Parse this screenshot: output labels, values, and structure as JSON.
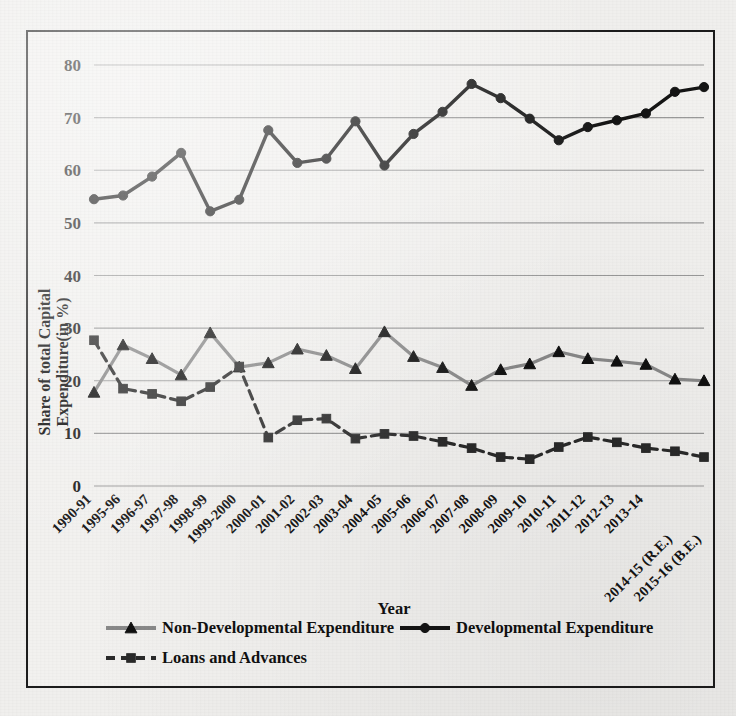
{
  "figure": {
    "background_color": "#f2f1ef",
    "frame_color": "#1c1c1c",
    "xlabel": "Year",
    "ylabel_line1": "Share of total Capital",
    "ylabel_line2": "Expenditure(in %)"
  },
  "legend": {
    "position": "bottom-left",
    "entries": [
      {
        "label": "Non-Developmental Expenditure",
        "marker": "triangle",
        "color": "#8a8a8a",
        "line": "solid"
      },
      {
        "label": "Developmental Expenditure",
        "marker": "circle",
        "color": "#141414",
        "line": "solid"
      },
      {
        "label": "Loans and Advances",
        "marker": "square",
        "color": "#2a2a2a",
        "line": "dashed"
      }
    ]
  },
  "chart_data": {
    "type": "line",
    "title": "",
    "xlabel": "Year",
    "ylabel": "Share of total Capital Expenditure(in %)",
    "ylim": [
      0,
      80
    ],
    "ytick_step": 10,
    "yticks": [
      0,
      10,
      20,
      30,
      40,
      50,
      60,
      70,
      80
    ],
    "grid": true,
    "grid_axis": "y",
    "legend_position": "bottom-left",
    "categories": [
      "1990-91",
      "1995-96",
      "1996-97",
      "1997-98",
      "1998-99",
      "1999-2000",
      "2000-01",
      "2001-02",
      "2002-03",
      "2003-04",
      "2004-05",
      "2005-06",
      "2006-07",
      "2007-08",
      "2008-09",
      "2009-10",
      "2010-11",
      "2011-12",
      "2012-13",
      "2013-14",
      "2014-15 (R.E.)",
      "2015-16 (B.E.)"
    ],
    "series": [
      {
        "name": "Non-Developmental Expenditure",
        "marker": "triangle",
        "color": "#8a8a8a",
        "linestyle": "solid",
        "values": [
          17.8,
          26.8,
          24.2,
          21.1,
          29.1,
          22.6,
          23.4,
          26.0,
          24.8,
          22.3,
          29.3,
          24.6,
          22.5,
          19.1,
          22.1,
          23.2,
          25.5,
          24.2,
          23.7,
          23.1,
          20.3,
          20.0
        ]
      },
      {
        "name": "Developmental Expenditure",
        "marker": "circle",
        "color": "#141414",
        "linestyle": "solid",
        "values": [
          54.5,
          55.2,
          58.8,
          63.3,
          52.2,
          54.4,
          67.6,
          61.4,
          62.2,
          69.3,
          60.9,
          66.9,
          71.1,
          76.4,
          73.7,
          69.8,
          65.7,
          68.2,
          69.5,
          70.8,
          74.9,
          75.8
        ]
      },
      {
        "name": "Loans and Advances",
        "marker": "square",
        "color": "#2a2a2a",
        "linestyle": "dashed",
        "values": [
          27.7,
          18.5,
          17.5,
          16.1,
          18.8,
          22.7,
          9.2,
          12.5,
          12.8,
          9.0,
          9.9,
          9.5,
          8.4,
          7.2,
          5.5,
          5.1,
          7.4,
          9.3,
          8.3,
          7.2,
          6.6,
          5.5
        ]
      }
    ]
  }
}
